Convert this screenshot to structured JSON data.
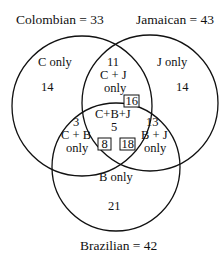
{
  "sets": {
    "colombian": {
      "label": "Colombian = 33"
    },
    "jamaican": {
      "label": "Jamaican = 43"
    },
    "brazilian": {
      "label": "Brazilian = 42"
    }
  },
  "regions": {
    "c_only": {
      "label": "C only",
      "value": "14"
    },
    "j_only": {
      "label": "J only",
      "value": "14"
    },
    "b_only": {
      "label": "B only",
      "value": "21"
    },
    "cj_only": {
      "value": "11",
      "label_line1": "C + J",
      "label_line2": "only"
    },
    "cb_only": {
      "value": "3",
      "label_line1": "C + B",
      "label_line2": "only"
    },
    "bj_only": {
      "value": "13",
      "label_line1": "B + J",
      "label_line2": "only"
    },
    "cbj": {
      "label": "C+B+J",
      "value": "5"
    }
  },
  "boxed_totals": {
    "cj": "16",
    "cb": "8",
    "bj": "18"
  }
}
